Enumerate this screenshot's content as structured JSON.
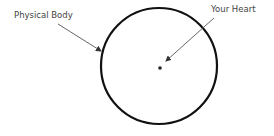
{
  "diagram": {
    "labels": {
      "physical_body": "Physical Body",
      "your_heart": "Your Heart"
    },
    "colors": {
      "circle_stroke": "#111111",
      "arrow_stroke": "#555555",
      "dot_fill": "#222222",
      "text": "#444444",
      "background": "#ffffff"
    },
    "shapes": {
      "circle": {
        "cx": 159,
        "cy": 66,
        "r": 58
      },
      "heart_dot": {
        "cx": 160,
        "cy": 68,
        "r": 1.8
      }
    },
    "arrows": [
      {
        "name": "physical-body-arrow",
        "from": [
          58,
          24
        ],
        "to": [
          102,
          51
        ]
      },
      {
        "name": "your-heart-arrow",
        "from": [
          214,
          18
        ],
        "to": [
          165,
          62
        ]
      }
    ]
  }
}
